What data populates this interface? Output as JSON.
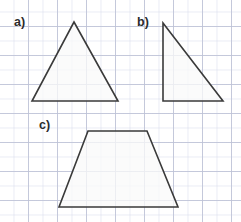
{
  "figure": {
    "background": "#ffffff",
    "grid": {
      "minor_color": "#d7dceb",
      "major_color": "#bec3d7",
      "minor_spacing_px": 14.5,
      "major_spacing_px": 29
    },
    "stroke_color": "#3a3a3a",
    "fill_color": "#fafafa",
    "width_px": 241,
    "height_px": 222
  },
  "labels": {
    "a": "a)",
    "b": "b)",
    "c": "c)"
  },
  "shapes": [
    {
      "key": "a",
      "label": "a)",
      "name": "triangle-isosceles",
      "points": "74,22 118,101 32,101",
      "vertices": [
        [
          74,
          22
        ],
        [
          118,
          101
        ],
        [
          32,
          101
        ]
      ]
    },
    {
      "key": "b",
      "label": "b)",
      "name": "triangle-right",
      "points": "163,23 223,101 163,101",
      "vertices": [
        [
          163,
          23
        ],
        [
          223,
          101
        ],
        [
          163,
          101
        ]
      ]
    },
    {
      "key": "c",
      "label": "c)",
      "name": "trapezoid",
      "points": "88,131 147,131 178,207 59,207",
      "vertices": [
        [
          88,
          131
        ],
        [
          147,
          131
        ],
        [
          178,
          207
        ],
        [
          59,
          207
        ]
      ]
    }
  ]
}
